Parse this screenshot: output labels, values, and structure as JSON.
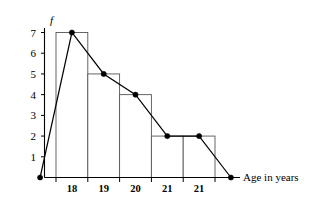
{
  "chart_data": {
    "type": "bar",
    "title": "",
    "subtitle": "",
    "xlabel": "Age in years",
    "ylabel": "f",
    "categories": [
      "18",
      "19",
      "20",
      "21",
      "21"
    ],
    "values": [
      7,
      5,
      4,
      2,
      2
    ],
    "ylim": [
      0,
      7
    ],
    "yticks": [
      "1",
      "2",
      "3",
      "4",
      "5",
      "6",
      "7"
    ],
    "ytick_values": [
      1,
      2,
      3,
      4,
      5,
      6,
      7
    ],
    "grid": false,
    "legend": null,
    "overlay": {
      "type": "line",
      "name": "frequency polygon",
      "points": [
        {
          "x": "",
          "y": 0
        },
        {
          "x": "18",
          "y": 7
        },
        {
          "x": "19",
          "y": 5
        },
        {
          "x": "20",
          "y": 4
        },
        {
          "x": "21",
          "y": 2
        },
        {
          "x": "21",
          "y": 2
        },
        {
          "x": "",
          "y": 0
        }
      ],
      "markers": "filled-circle"
    },
    "annotations": []
  },
  "figure": {
    "axis_x_name": "x-axis",
    "axis_y_name": "y-axis"
  }
}
